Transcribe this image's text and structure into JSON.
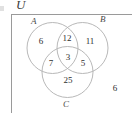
{
  "figure": {
    "type": "venn-diagram",
    "universe_label": "U",
    "set_labels": {
      "a": "A",
      "b": "B",
      "c": "C"
    },
    "region_counts": {
      "a_only": "6",
      "a_and_b_only": "12",
      "b_only": "11",
      "a_and_c_only": "7",
      "a_and_b_and_c": "3",
      "b_and_c_only": "5",
      "c_only": "25",
      "outside_all_sets": "6"
    },
    "colors": {
      "circle_stroke": "#b0b0b0",
      "box_stroke": "#9a9a9a",
      "text": "#2e2e2e",
      "label_text": "#4a4a4a",
      "background": "#ffffff"
    }
  }
}
